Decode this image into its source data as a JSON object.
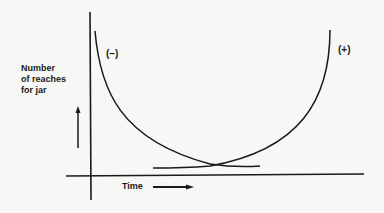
{
  "diagram": {
    "y_axis_label": {
      "line1": "Number",
      "line2": "of reaches",
      "line3": "for jar"
    },
    "x_axis_label": "Time",
    "curves": [
      {
        "name": "negative-curve",
        "label": "(–)",
        "description": "decreasing curve"
      },
      {
        "name": "positive-curve",
        "label": "(+)",
        "description": "increasing curve"
      }
    ],
    "colors": {
      "ink": "#1a1a1a",
      "background": "#f7f7f5"
    }
  }
}
